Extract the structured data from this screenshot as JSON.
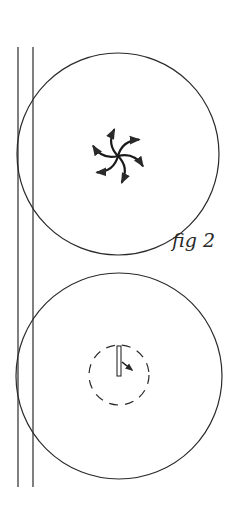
{
  "figure": {
    "label": "fig 2",
    "colors": {
      "stroke": "#2a2a2a",
      "background": "#ffffff"
    },
    "rails": [
      {
        "x": 18,
        "y1": 47,
        "y2": 487
      },
      {
        "x": 33,
        "y1": 47,
        "y2": 487
      }
    ],
    "circles": [
      {
        "name": "upper-circle",
        "cx": 118,
        "cy": 154,
        "r": 101,
        "content": "pinwheel-vortex"
      },
      {
        "name": "lower-circle",
        "cx": 119,
        "cy": 376,
        "r": 103,
        "content": "bar-with-dashed-ring"
      }
    ],
    "pinwheel": {
      "cx": 118,
      "cy": 156,
      "arms": 6,
      "arm_length": 28
    },
    "dashed_ring": {
      "cx": 119,
      "cy": 375,
      "r": 30
    },
    "bar": {
      "x": 117,
      "y": 346,
      "width": 4,
      "height": 30
    },
    "label_position": {
      "x": 172,
      "y": 247
    }
  }
}
